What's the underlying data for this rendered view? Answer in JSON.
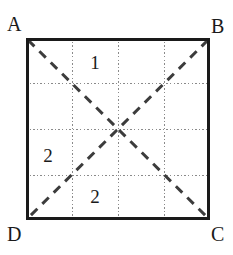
{
  "figure": {
    "type": "geometry-diagram",
    "background_color": "#ffffff",
    "square": {
      "name": "ABCD",
      "x": 26,
      "y": 38,
      "width": 184,
      "height": 182,
      "border_color": "#1a1a1a",
      "border_width": 3,
      "fill_color": "#ffffff"
    },
    "vertex_labels": [
      {
        "id": "A",
        "text": "A",
        "corner": "top-left",
        "x": 7,
        "y": 14
      },
      {
        "id": "B",
        "text": "B",
        "corner": "top-right",
        "x": 211,
        "y": 16
      },
      {
        "id": "C",
        "text": "C",
        "corner": "bottom-right",
        "x": 211,
        "y": 224
      },
      {
        "id": "D",
        "text": "D",
        "corner": "bottom-left",
        "x": 7,
        "y": 224
      }
    ],
    "grid": {
      "style": "dotted",
      "color": "#8a8a8a",
      "line_width": 1,
      "divisions": 4,
      "vertical_lines_x": [
        72,
        118,
        164
      ],
      "horizontal_lines_y": [
        83.5,
        129,
        174.5
      ]
    },
    "diagonals": {
      "style": "dashed",
      "color": "#3c3c3c",
      "line_width": 3,
      "dash_pattern": "9 7",
      "lines": [
        {
          "id": "AC",
          "from": "A",
          "to": "C",
          "x1": 28,
          "y1": 40,
          "x2": 208,
          "y2": 218
        },
        {
          "id": "BD",
          "from": "B",
          "to": "D",
          "x1": 208,
          "y1": 40,
          "x2": 28,
          "y2": 218
        }
      ],
      "intersection": {
        "x": 118,
        "y": 129
      }
    },
    "region_labels": [
      {
        "id": "region-1",
        "text": "1",
        "x": 95,
        "y": 62,
        "region": "top"
      },
      {
        "id": "region-2-left",
        "text": "2",
        "x": 48,
        "y": 155,
        "region": "left"
      },
      {
        "id": "region-2-bottom",
        "text": "2",
        "x": 95,
        "y": 196,
        "region": "bottom"
      }
    ]
  }
}
